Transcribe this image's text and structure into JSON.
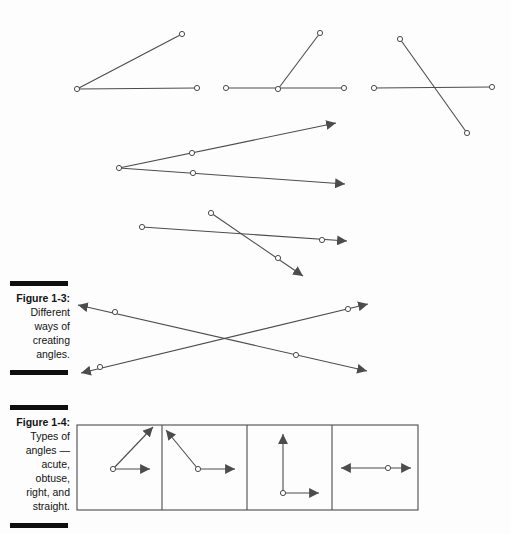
{
  "page": {
    "background": "#fdfdfd",
    "text_color": "#131313",
    "rule_color": "#0f0f0f"
  },
  "figure_1_3": {
    "label": "Figure 1-3:",
    "caption": [
      "Different",
      "ways of",
      "creating",
      "angles."
    ]
  },
  "figure_1_4": {
    "label": "Figure 1-4:",
    "caption": [
      "Types of",
      "angles —",
      "acute,",
      "obtuse,",
      "right, and",
      "straight."
    ]
  },
  "drawing": {
    "stroke": "#4c4c4c",
    "stroke_width": 1.1,
    "dot_radius": 2.6,
    "dot_fill": "#fdfdfd",
    "rects": [
      {
        "name": "figure-1-4-frame",
        "x": 77,
        "y": 425,
        "w": 341,
        "h": 85
      }
    ],
    "lines": [
      {
        "name": "fig3-angle1-base-segment",
        "x1": 77,
        "y1": 89,
        "x2": 197,
        "y2": 88
      },
      {
        "name": "fig3-angle1-slanted-segment",
        "x1": 77,
        "y1": 89,
        "x2": 182,
        "y2": 34
      },
      {
        "name": "fig3-angle2-base-segment",
        "x1": 226,
        "y1": 88,
        "x2": 344,
        "y2": 88
      },
      {
        "name": "fig3-angle2-slanted-segment",
        "x1": 278,
        "y1": 89,
        "x2": 320,
        "y2": 33
      },
      {
        "name": "fig3-angle3-horizontal-segment",
        "x1": 374,
        "y1": 88,
        "x2": 492,
        "y2": 87
      },
      {
        "name": "fig3-angle3-diagonal-segment",
        "x1": 400,
        "y1": 39,
        "x2": 467,
        "y2": 133
      },
      {
        "name": "fig3-angle4-upper-ray",
        "x1": 119,
        "y1": 168,
        "x2": 336,
        "y2": 123,
        "a2": true
      },
      {
        "name": "fig3-angle4-lower-ray",
        "x1": 119,
        "y1": 168,
        "x2": 345,
        "y2": 184,
        "a2": true
      },
      {
        "name": "fig3-angle5-shallow-ray",
        "x1": 142,
        "y1": 227,
        "x2": 347,
        "y2": 241,
        "a2": true
      },
      {
        "name": "fig3-angle5-steep-ray",
        "x1": 211,
        "y1": 213,
        "x2": 303,
        "y2": 276,
        "a2": true
      },
      {
        "name": "fig3-angle6-crossing-line-1",
        "x1": 78,
        "y1": 305,
        "x2": 367,
        "y2": 371,
        "a1": true,
        "a2": true
      },
      {
        "name": "fig3-angle6-crossing-line-2",
        "x1": 81,
        "y1": 373,
        "x2": 368,
        "y2": 304,
        "a1": true,
        "a2": true
      },
      {
        "name": "fig4-cell-divider-1",
        "x1": 162,
        "y1": 425,
        "x2": 162,
        "y2": 510
      },
      {
        "name": "fig4-cell-divider-2",
        "x1": 247,
        "y1": 425,
        "x2": 247,
        "y2": 510
      },
      {
        "name": "fig4-cell-divider-3",
        "x1": 332,
        "y1": 425,
        "x2": 332,
        "y2": 510
      },
      {
        "name": "fig4-acute-horizontal-ray",
        "x1": 113,
        "y1": 469,
        "x2": 150,
        "y2": 469,
        "a2": true
      },
      {
        "name": "fig4-acute-diagonal-ray",
        "x1": 113,
        "y1": 469,
        "x2": 153,
        "y2": 427,
        "a2": true
      },
      {
        "name": "fig4-obtuse-horizontal-ray",
        "x1": 198,
        "y1": 469,
        "x2": 235,
        "y2": 469,
        "a2": true
      },
      {
        "name": "fig4-obtuse-diagonal-ray",
        "x1": 198,
        "y1": 469,
        "x2": 166,
        "y2": 430,
        "a2": true
      },
      {
        "name": "fig4-right-vertical-ray",
        "x1": 283,
        "y1": 493,
        "x2": 283,
        "y2": 434,
        "a2": true
      },
      {
        "name": "fig4-right-horizontal-ray",
        "x1": 283,
        "y1": 493,
        "x2": 319,
        "y2": 493,
        "a2": true
      },
      {
        "name": "fig4-straight-line",
        "x1": 341,
        "y1": 468,
        "x2": 411,
        "y2": 468,
        "a1": true,
        "a2": true
      }
    ],
    "dots": [
      {
        "x": 77,
        "y": 89
      },
      {
        "x": 197,
        "y": 88
      },
      {
        "x": 182,
        "y": 34
      },
      {
        "x": 226,
        "y": 88
      },
      {
        "x": 278,
        "y": 89
      },
      {
        "x": 344,
        "y": 88
      },
      {
        "x": 320,
        "y": 33
      },
      {
        "x": 374,
        "y": 88
      },
      {
        "x": 492,
        "y": 87
      },
      {
        "x": 400,
        "y": 39
      },
      {
        "x": 467,
        "y": 133
      },
      {
        "x": 119,
        "y": 168
      },
      {
        "x": 192,
        "y": 153
      },
      {
        "x": 193,
        "y": 173
      },
      {
        "x": 142,
        "y": 227
      },
      {
        "x": 322,
        "y": 240
      },
      {
        "x": 211,
        "y": 213
      },
      {
        "x": 278,
        "y": 258
      },
      {
        "x": 115,
        "y": 312
      },
      {
        "x": 296,
        "y": 355
      },
      {
        "x": 100,
        "y": 367
      },
      {
        "x": 348,
        "y": 309
      },
      {
        "x": 113,
        "y": 469
      },
      {
        "x": 198,
        "y": 469
      },
      {
        "x": 283,
        "y": 493
      },
      {
        "x": 388,
        "y": 468
      }
    ]
  }
}
